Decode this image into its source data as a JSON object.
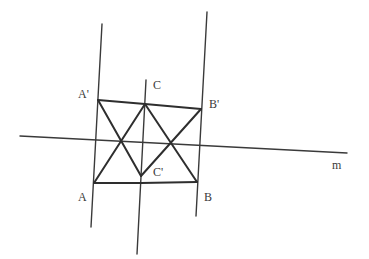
{
  "diagram": {
    "type": "geometry-reflection",
    "stroke_color": "#3a3a3a",
    "background": "#ffffff",
    "lines": {
      "left_vertical": {
        "x1": 102,
        "y1": 24,
        "x2": 91,
        "y2": 227
      },
      "middle_vertical": {
        "x1": 146,
        "y1": 80,
        "x2": 137,
        "y2": 254
      },
      "right_vertical": {
        "x1": 207,
        "y1": 12,
        "x2": 196,
        "y2": 216
      },
      "line_m": {
        "x1": 20,
        "y1": 136,
        "x2": 347,
        "y2": 153
      }
    },
    "points": {
      "A_prime": {
        "label": "A'",
        "x": 98,
        "y": 100
      },
      "C": {
        "label": "C",
        "x": 145,
        "y": 104
      },
      "B_prime": {
        "label": "B'",
        "x": 201,
        "y": 109
      },
      "A": {
        "label": "A",
        "x": 94,
        "y": 183
      },
      "C_prime": {
        "label": "C'",
        "x": 141,
        "y": 176
      },
      "B": {
        "label": "B",
        "x": 197,
        "y": 182
      }
    },
    "labels": {
      "A_prime": "A'",
      "C": "C",
      "B_prime": "B'",
      "A": "A",
      "C_prime": "C'",
      "B": "B",
      "m": "m"
    }
  }
}
